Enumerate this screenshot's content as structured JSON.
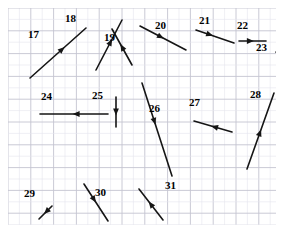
{
  "figure": {
    "kind": "vector-diagram",
    "background_color": "#ffffff",
    "grid": {
      "minor_color": "#e4e4ec",
      "major_color": "#c4c4d0",
      "minor_spacing_px": 11.4,
      "major_every": 2,
      "left": 8,
      "top": 8,
      "width": 268,
      "height": 217
    },
    "vector_color": "#151515",
    "label_color": "#000000"
  },
  "chart_data": {
    "type": "scatter",
    "title": "",
    "xlabel": "",
    "ylabel": "",
    "vectors": [
      {
        "label": "17",
        "x1": 22,
        "y1": 70,
        "x2": 78,
        "y2": 20,
        "arrow_t": 0.62,
        "label_x": 28,
        "label_y": 29
      },
      {
        "label": "18",
        "x1": 88,
        "y1": 62,
        "x2": 114,
        "y2": 12,
        "arrow_t": 0.62,
        "label_x": 65,
        "label_y": 13
      },
      {
        "label": "19",
        "x1": 124,
        "y1": 57,
        "x2": 104,
        "y2": 21,
        "arrow_t": 0.58,
        "label_x": 104,
        "label_y": 32
      },
      {
        "label": "20",
        "x1": 132,
        "y1": 18,
        "x2": 178,
        "y2": 42,
        "arrow_t": 0.52,
        "label_x": 155,
        "label_y": 20
      },
      {
        "label": "21",
        "x1": 188,
        "y1": 22,
        "x2": 226,
        "y2": 35,
        "arrow_t": 0.45,
        "label_x": 199,
        "label_y": 15
      },
      {
        "label": "22",
        "x1": 231,
        "y1": 33,
        "x2": 258,
        "y2": 33,
        "arrow_t": 0.55,
        "label_x": 237,
        "label_y": 20
      },
      {
        "label": "23",
        "x1": 270,
        "y1": 70,
        "x2": 270,
        "y2": 18,
        "arrow_t": 0.62,
        "label_x": 256,
        "label_y": 42
      },
      {
        "label": "24",
        "x1": 100,
        "y1": 106,
        "x2": 32,
        "y2": 106,
        "arrow_t": 0.52,
        "label_x": 41,
        "label_y": 91
      },
      {
        "label": "25",
        "x1": 108,
        "y1": 89,
        "x2": 108,
        "y2": 119,
        "arrow_t": 0.62,
        "label_x": 92,
        "label_y": 90
      },
      {
        "label": "26",
        "x1": 134,
        "y1": 75,
        "x2": 164,
        "y2": 168,
        "arrow_t": 0.45,
        "label_x": 149,
        "label_y": 103
      },
      {
        "label": "27",
        "x1": 224,
        "y1": 124,
        "x2": 186,
        "y2": 113,
        "arrow_t": 0.55,
        "label_x": 189,
        "label_y": 97
      },
      {
        "label": "28",
        "x1": 239,
        "y1": 161,
        "x2": 266,
        "y2": 85,
        "arrow_t": 0.52,
        "label_x": 250,
        "label_y": 89
      },
      {
        "label": "29",
        "x1": 44,
        "y1": 198,
        "x2": 31,
        "y2": 211,
        "arrow_t": 0.62,
        "label_x": 24,
        "label_y": 188
      },
      {
        "label": "30",
        "x1": 76,
        "y1": 176,
        "x2": 100,
        "y2": 213,
        "arrow_t": 0.5,
        "label_x": 95,
        "label_y": 187
      },
      {
        "label": "31",
        "x1": 155,
        "y1": 212,
        "x2": 131,
        "y2": 181,
        "arrow_t": 0.6,
        "label_x": 165,
        "label_y": 180
      }
    ]
  }
}
